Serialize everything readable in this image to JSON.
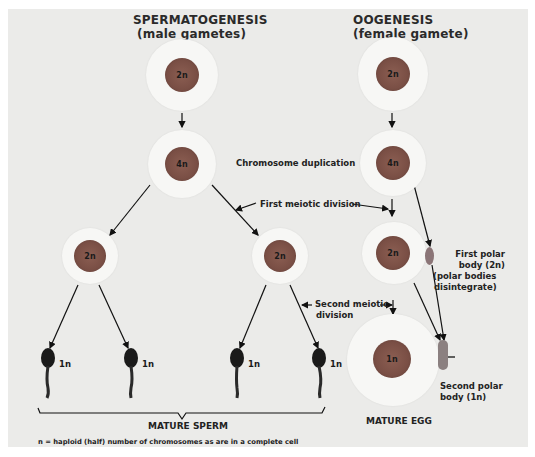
{
  "headers": {
    "spermatogenesis_title": "SPERMATOGENESIS",
    "spermatogenesis_subtitle": "(male gametes)",
    "oogenesis_title": "OOGENESIS",
    "oogenesis_subtitle": "(female gamete)"
  },
  "stage_labels": {
    "chromosome_duplication": "Chromosome duplication",
    "first_meiotic_division": "First meiotic division",
    "second_meiotic_division_line1": "Second meiotic",
    "second_meiotic_division_line2": "division"
  },
  "spermatogenesis": {
    "cells": [
      {
        "id": "primary",
        "ploidy": "2n"
      },
      {
        "id": "duplicated",
        "ploidy": "4n"
      },
      {
        "id": "secondary-left",
        "ploidy": "2n"
      },
      {
        "id": "secondary-right",
        "ploidy": "2n"
      }
    ],
    "sperm": [
      {
        "ploidy": "1n"
      },
      {
        "ploidy": "1n"
      },
      {
        "ploidy": "1n"
      },
      {
        "ploidy": "1n"
      }
    ],
    "mature_label": "MATURE SPERM"
  },
  "oogenesis": {
    "cells": [
      {
        "id": "primary",
        "ploidy": "2n"
      },
      {
        "id": "duplicated",
        "ploidy": "4n"
      },
      {
        "id": "secondary",
        "ploidy": "2n"
      },
      {
        "id": "egg",
        "ploidy": "1n"
      }
    ],
    "first_polar_body": {
      "line1": "First polar",
      "line2": "body (2n)",
      "line3": "(polar bodies",
      "line4": "disintegrate)"
    },
    "second_polar_body": {
      "line1": "Second polar",
      "line2": "body (1n)"
    },
    "mature_label": "MATURE EGG"
  },
  "footnote": "n = haploid (half) number of chromosomes as are in a complete cell",
  "colors": {
    "background": "#ebebe9",
    "cell_membrane": "#f7f7f5",
    "nucleus": "#7a4f45",
    "sperm": "#1a1a1a",
    "polar_body": "#8a7a7a",
    "text": "#222222"
  }
}
